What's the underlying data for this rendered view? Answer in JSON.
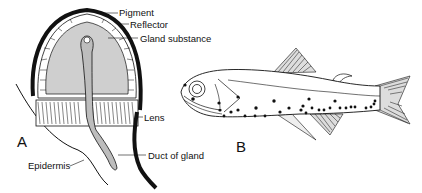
{
  "figure": {
    "panel_a": {
      "letter": "A",
      "subject": "photophore cross-section",
      "labels": {
        "pigment": "Pigment",
        "reflector": "Reflector",
        "gland_substance": "Gland substance",
        "lens": "Lens",
        "duct_of_gland": "Duct of gland",
        "epidermis": "Epidermis"
      }
    },
    "panel_b": {
      "letter": "B",
      "subject": "lanternfish with photophores"
    },
    "colors": {
      "ink": "#111111",
      "gland_fill": "#cfcfcf",
      "background": "#ffffff"
    }
  }
}
